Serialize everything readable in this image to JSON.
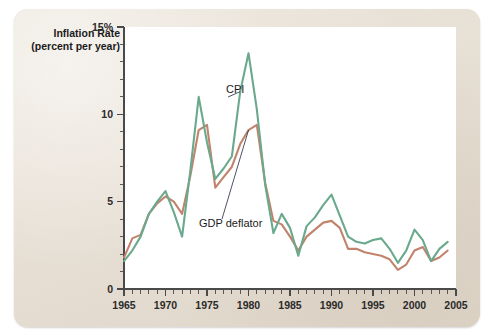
{
  "figure": {
    "card_background": "#e9e2d8",
    "plot_background": "#ffffff"
  },
  "chart_data": {
    "type": "line",
    "title": "",
    "subtitle": "",
    "xlabel": "",
    "ylabel": "Inflation Rate",
    "ylabel_line2": "(percent per year)",
    "xlim": [
      1965,
      2005
    ],
    "ylim": [
      0,
      15
    ],
    "grid": false,
    "legend_position": "inline-annotations",
    "y_ticks_major": [
      0,
      5,
      10,
      15
    ],
    "y_tick_labels": [
      "0",
      "5",
      "10",
      "15%"
    ],
    "y_tick_minor_step": 1,
    "x_ticks_major": [
      1965,
      1970,
      1975,
      1980,
      1985,
      1990,
      1995,
      2000,
      2005
    ],
    "x_tick_labels": [
      "1965",
      "1970",
      "1975",
      "1980",
      "1985",
      "1990",
      "1995",
      "2000",
      "2005"
    ],
    "x_tick_minor_step": 1,
    "x": [
      1965,
      1966,
      1967,
      1968,
      1969,
      1970,
      1971,
      1972,
      1973,
      1974,
      1975,
      1976,
      1977,
      1978,
      1979,
      1980,
      1981,
      1982,
      1983,
      1984,
      1985,
      1986,
      1987,
      1988,
      1989,
      1990,
      1991,
      1992,
      1993,
      1994,
      1995,
      1996,
      1997,
      1998,
      1999,
      2000,
      2001,
      2002,
      2003,
      2004
    ],
    "series": [
      {
        "name": "CPI",
        "color": "#6aa98d",
        "values": [
          1.6,
          2.2,
          3.0,
          4.3,
          5.0,
          5.6,
          4.4,
          3.0,
          6.8,
          11.0,
          8.4,
          6.3,
          6.9,
          7.6,
          11.3,
          13.5,
          10.3,
          6.0,
          3.2,
          4.3,
          3.5,
          1.9,
          3.6,
          4.1,
          4.8,
          5.4,
          4.2,
          3.0,
          2.7,
          2.6,
          2.8,
          2.9,
          2.3,
          1.5,
          2.2,
          3.4,
          2.8,
          1.6,
          2.3,
          2.7
        ],
        "label_annotation": "CPI"
      },
      {
        "name": "GDP deflator",
        "color": "#c2836c",
        "values": [
          1.8,
          2.9,
          3.1,
          4.3,
          4.9,
          5.3,
          5.0,
          4.3,
          6.5,
          9.1,
          9.4,
          5.8,
          6.4,
          7.0,
          8.3,
          9.1,
          9.4,
          6.1,
          3.9,
          3.7,
          3.0,
          2.2,
          3.0,
          3.4,
          3.8,
          3.9,
          3.5,
          2.3,
          2.3,
          2.1,
          2.0,
          1.9,
          1.7,
          1.1,
          1.4,
          2.2,
          2.4,
          1.6,
          1.8,
          2.2
        ],
        "label_annotation": "GDP deflator"
      }
    ],
    "annotations": [
      {
        "text": "CPI",
        "points_to_series": "CPI",
        "points_to_year": 1979
      },
      {
        "text": "GDP deflator",
        "points_to_series": "GDP deflator",
        "points_to_year": 1980
      }
    ]
  }
}
